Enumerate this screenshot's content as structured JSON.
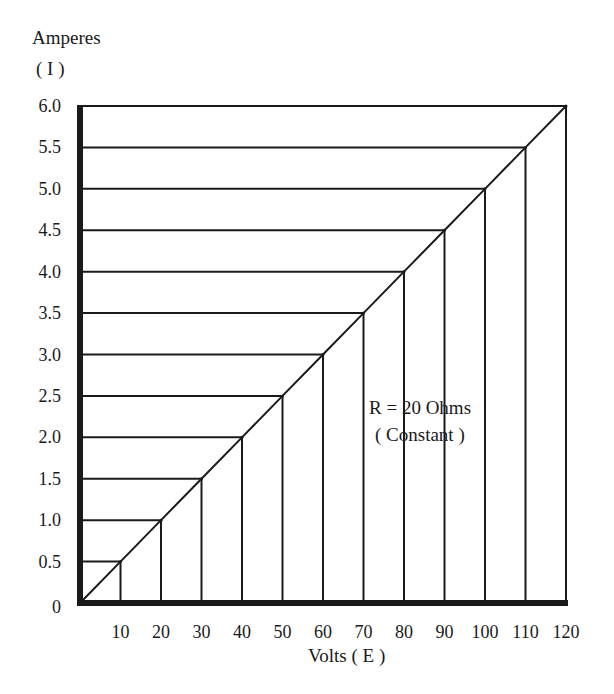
{
  "chart_data": {
    "type": "line",
    "title": "",
    "ylabel_line1": "Amperes",
    "ylabel_line2": "( I )",
    "xlabel": "Volts ( E )",
    "annotation_line1": "R = 20 Ohms",
    "annotation_line2": "( Constant )",
    "xlim": [
      0,
      120
    ],
    "ylim": [
      0,
      6.0
    ],
    "x_ticks": [
      10,
      20,
      30,
      40,
      50,
      60,
      70,
      80,
      90,
      100,
      110,
      120
    ],
    "x_tick_labels": [
      "10",
      "20",
      "30",
      "40",
      "50",
      "60",
      "70",
      "80",
      "90",
      "100",
      "110",
      "120"
    ],
    "y_ticks": [
      0,
      0.5,
      1.0,
      1.5,
      2.0,
      2.5,
      3.0,
      3.5,
      4.0,
      4.5,
      5.0,
      5.5,
      6.0
    ],
    "y_tick_labels": [
      "0",
      "0.5",
      "1.0",
      "1.5",
      "2.0",
      "2.5",
      "3.0",
      "3.5",
      "4.0",
      "4.5",
      "5.0",
      "5.5",
      "6.0"
    ],
    "series": [
      {
        "name": "I = E / R",
        "x": [
          0,
          10,
          20,
          30,
          40,
          50,
          60,
          70,
          80,
          90,
          100,
          110,
          120
        ],
        "y": [
          0,
          0.5,
          1.0,
          1.5,
          2.0,
          2.5,
          3.0,
          3.5,
          4.0,
          4.5,
          5.0,
          5.5,
          6.0
        ]
      }
    ],
    "grid": "drop-lines from each point to both axes",
    "legend": "none"
  }
}
